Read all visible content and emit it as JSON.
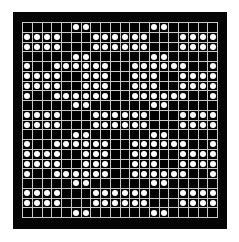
{
  "figure": {
    "frame_color": "#050505",
    "page_background": "#ffffff",
    "grid_line_color": "#c9c9c9",
    "cell_off_color": "#000000",
    "dot_color": "#fdfdfd"
  },
  "chart_data": {
    "type": "heatmap",
    "xlabel": "",
    "ylabel": "",
    "rows": 20,
    "columns": 20,
    "grid": true,
    "legend": "none",
    "value_labels": {
      "0": "empty cell",
      "1": "dot present"
    },
    "symmetry": "horizontal and vertical mirror about the center axes",
    "matrix": [
      [
        0,
        0,
        0,
        0,
        0,
        1,
        1,
        0,
        0,
        0,
        0,
        0,
        0,
        1,
        1,
        0,
        0,
        0,
        0,
        0
      ],
      [
        1,
        1,
        1,
        1,
        0,
        0,
        0,
        1,
        1,
        1,
        1,
        1,
        1,
        0,
        0,
        0,
        1,
        1,
        1,
        1
      ],
      [
        1,
        1,
        1,
        1,
        0,
        0,
        0,
        1,
        1,
        1,
        1,
        1,
        1,
        0,
        0,
        0,
        1,
        1,
        1,
        1
      ],
      [
        0,
        0,
        0,
        0,
        0,
        1,
        1,
        0,
        0,
        0,
        0,
        0,
        0,
        1,
        1,
        0,
        0,
        0,
        0,
        0
      ],
      [
        1,
        0,
        0,
        1,
        1,
        1,
        1,
        1,
        1,
        0,
        0,
        1,
        1,
        1,
        1,
        1,
        1,
        0,
        0,
        1
      ],
      [
        1,
        1,
        1,
        1,
        0,
        0,
        1,
        1,
        1,
        0,
        0,
        1,
        1,
        1,
        0,
        0,
        1,
        1,
        1,
        1
      ],
      [
        1,
        1,
        1,
        1,
        0,
        0,
        1,
        1,
        1,
        0,
        0,
        1,
        1,
        1,
        0,
        0,
        1,
        1,
        1,
        1
      ],
      [
        1,
        0,
        0,
        1,
        1,
        1,
        1,
        1,
        1,
        0,
        0,
        1,
        1,
        1,
        1,
        1,
        1,
        0,
        0,
        1
      ],
      [
        0,
        0,
        0,
        0,
        0,
        1,
        1,
        0,
        0,
        0,
        0,
        0,
        0,
        1,
        1,
        0,
        0,
        0,
        0,
        0
      ],
      [
        1,
        1,
        1,
        1,
        0,
        0,
        0,
        1,
        1,
        1,
        1,
        1,
        1,
        0,
        0,
        0,
        1,
        1,
        1,
        1
      ],
      [
        1,
        1,
        1,
        1,
        0,
        0,
        0,
        1,
        1,
        1,
        1,
        1,
        1,
        0,
        0,
        0,
        1,
        1,
        1,
        1
      ],
      [
        0,
        0,
        0,
        0,
        0,
        1,
        1,
        0,
        0,
        0,
        0,
        0,
        0,
        1,
        1,
        0,
        0,
        0,
        0,
        0
      ],
      [
        1,
        0,
        0,
        1,
        1,
        1,
        1,
        1,
        1,
        0,
        0,
        1,
        1,
        1,
        1,
        1,
        1,
        0,
        0,
        1
      ],
      [
        1,
        1,
        1,
        1,
        0,
        0,
        1,
        1,
        1,
        0,
        0,
        1,
        1,
        1,
        0,
        0,
        1,
        1,
        1,
        1
      ],
      [
        1,
        1,
        1,
        1,
        0,
        0,
        1,
        1,
        1,
        0,
        0,
        1,
        1,
        1,
        0,
        0,
        1,
        1,
        1,
        1
      ],
      [
        1,
        0,
        0,
        1,
        1,
        1,
        1,
        1,
        1,
        0,
        0,
        1,
        1,
        1,
        1,
        1,
        1,
        0,
        0,
        1
      ],
      [
        0,
        0,
        0,
        0,
        0,
        1,
        1,
        0,
        0,
        0,
        0,
        0,
        0,
        1,
        1,
        0,
        0,
        0,
        0,
        0
      ],
      [
        1,
        1,
        1,
        1,
        0,
        0,
        0,
        1,
        1,
        1,
        1,
        1,
        1,
        0,
        0,
        0,
        1,
        1,
        1,
        1
      ],
      [
        1,
        1,
        1,
        1,
        0,
        0,
        0,
        1,
        1,
        1,
        1,
        1,
        1,
        0,
        0,
        0,
        1,
        1,
        1,
        1
      ],
      [
        0,
        0,
        0,
        0,
        0,
        1,
        1,
        0,
        0,
        0,
        0,
        0,
        0,
        1,
        1,
        0,
        0,
        0,
        0,
        0
      ]
    ]
  }
}
